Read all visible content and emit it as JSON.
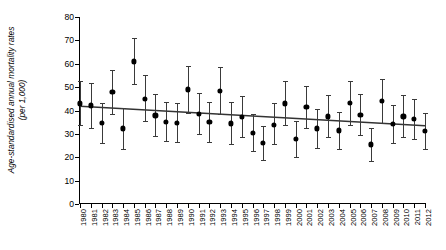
{
  "chart_data": {
    "type": "scatter",
    "title": "",
    "subtitle": "",
    "xlabel": "",
    "ylabel": "Age-standardised annual mortality rates\n(per 1,000)",
    "ylim": [
      0,
      80
    ],
    "yticks": [
      0,
      10,
      20,
      30,
      40,
      50,
      60,
      70,
      80
    ],
    "ytick_labels": [
      "0",
      "10",
      "20",
      "30",
      "40",
      "50",
      "60",
      "70",
      "80"
    ],
    "grid": false,
    "legend": null,
    "error_bars": "vertical, capped (95% confidence intervals)",
    "categories": [
      "1980",
      "1981",
      "1982",
      "1983",
      "1984",
      "1985",
      "1986",
      "1987",
      "1988",
      "1989",
      "1990",
      "1991",
      "1992",
      "1993",
      "1994",
      "1995",
      "1996",
      "1997",
      "1998",
      "1999",
      "2000",
      "2001",
      "2002",
      "2003",
      "2004",
      "2005",
      "2006",
      "2007",
      "2008",
      "2009",
      "2010",
      "2011",
      "2012"
    ],
    "x": [
      1980,
      1981,
      1982,
      1983,
      1984,
      1985,
      1986,
      1987,
      1988,
      1989,
      1990,
      1991,
      1992,
      1993,
      1994,
      1995,
      1996,
      1997,
      1998,
      1999,
      2000,
      2001,
      2002,
      2003,
      2004,
      2005,
      2006,
      2007,
      2008,
      2009,
      2010,
      2011,
      2012
    ],
    "values": [
      43.0,
      42.2,
      34.7,
      47.8,
      32.3,
      61.0,
      45.0,
      37.9,
      35.0,
      34.7,
      49.0,
      38.6,
      35.0,
      48.5,
      34.5,
      37.2,
      30.5,
      26.0,
      34.0,
      43.0,
      27.7,
      41.4,
      32.3,
      37.5,
      31.5,
      43.3,
      38.0,
      25.5,
      44.0,
      34.3,
      37.5,
      36.5,
      31.3
    ],
    "err_low": [
      33.6,
      32.5,
      26.3,
      38.5,
      23.5,
      51.5,
      35.5,
      28.9,
      27.0,
      26.5,
      39.0,
      30.0,
      26.5,
      38.5,
      25.5,
      28.7,
      22.5,
      19.0,
      25.5,
      33.8,
      20.0,
      32.5,
      24.0,
      28.5,
      23.5,
      34.0,
      29.5,
      18.5,
      34.5,
      26.0,
      28.5,
      28.0,
      23.5
    ],
    "err_high": [
      52.5,
      51.8,
      43.0,
      57.3,
      41.0,
      71.0,
      55.0,
      47.0,
      43.5,
      43.0,
      59.0,
      47.5,
      43.5,
      58.5,
      43.5,
      46.0,
      38.5,
      33.5,
      43.0,
      52.5,
      35.5,
      50.5,
      40.5,
      46.5,
      39.5,
      52.5,
      47.0,
      32.5,
      53.5,
      42.5,
      46.5,
      45.0,
      39.0
    ],
    "trend_line": {
      "x_start": 1980,
      "y_start": 41.8,
      "x_end": 2012,
      "y_end": 33.5,
      "color": "#333333"
    },
    "point_color": "#000000",
    "errorbar_color": "#3a3a3a"
  }
}
